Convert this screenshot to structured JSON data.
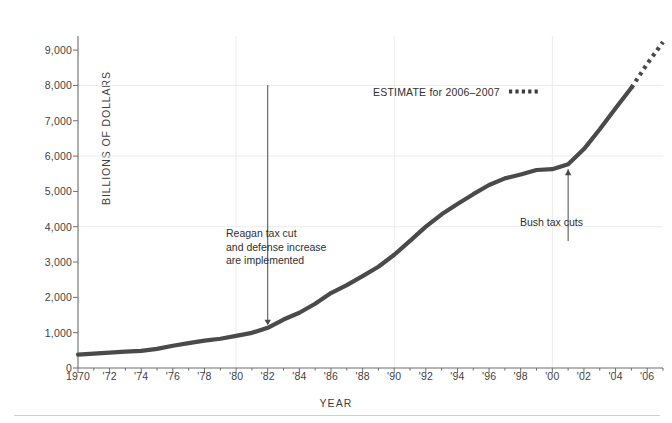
{
  "figure": {
    "clipped_top_text": "",
    "ylabel": "BILLIONS OF DOLLARS",
    "xlabel": "YEAR",
    "estimate_note": "ESTIMATE for 2006–2007",
    "annotations": {
      "reagan_line1": "Reagan tax cut",
      "reagan_line2": "and defense increase",
      "reagan_line3": "are implemented",
      "bush": "Bush tax cuts"
    },
    "colors": {
      "line": "#4a4a4a",
      "axis": "#6d6d6d",
      "grid": "#ececec",
      "text": "#3f3f3f"
    }
  },
  "chart_data": {
    "type": "line",
    "title": "",
    "xlabel": "YEAR",
    "ylabel": "BILLIONS OF DOLLARS",
    "xlim": [
      1970,
      2007
    ],
    "ylim": [
      0,
      9400
    ],
    "yticks": [
      0,
      1000,
      2000,
      3000,
      4000,
      5000,
      6000,
      7000,
      8000,
      9000
    ],
    "ytick_labels": [
      "0",
      "1,000",
      "2,000",
      "3,000",
      "4,000",
      "5,000",
      "6,000",
      "7,000",
      "8,000",
      "9,000"
    ],
    "xticks": [
      1970,
      1972,
      1974,
      1976,
      1978,
      1980,
      1982,
      1984,
      1986,
      1988,
      1990,
      1992,
      1994,
      1996,
      1998,
      2000,
      2002,
      2004,
      2006
    ],
    "xtick_labels": [
      "1970",
      "'72",
      "'74",
      "'76",
      "'78",
      "'80",
      "'82",
      "'84",
      "'86",
      "'88",
      "'90",
      "'92",
      "'94",
      "'96",
      "'98",
      "'00",
      "'02",
      "'04",
      "'06"
    ],
    "grid": {
      "horizontal_at": [
        4000,
        6000,
        8000
      ],
      "vertical_at": [
        1980,
        1990,
        2000
      ]
    },
    "legend": {
      "position": "upper-center",
      "entries": [
        "ESTIMATE for 2006–2007"
      ]
    },
    "series": [
      {
        "name": "Gross federal debt",
        "style": "solid",
        "x": [
          1970,
          1971,
          1972,
          1973,
          1974,
          1975,
          1976,
          1977,
          1978,
          1979,
          1980,
          1981,
          1982,
          1983,
          1984,
          1985,
          1986,
          1987,
          1988,
          1989,
          1990,
          1991,
          1992,
          1993,
          1994,
          1995,
          1996,
          1997,
          1998,
          1999,
          2000,
          2001,
          2002,
          2003,
          2004,
          2005
        ],
        "values": [
          381,
          408,
          436,
          466,
          484,
          541,
          629,
          706,
          777,
          829,
          909,
          995,
          1137,
          1372,
          1565,
          1818,
          2121,
          2346,
          2601,
          2868,
          3206,
          3598,
          4002,
          4351,
          4643,
          4921,
          5181,
          5369,
          5478,
          5606,
          5629,
          5770,
          6198,
          6760,
          7355,
          7933
        ]
      },
      {
        "name": "Estimate",
        "style": "dotted",
        "x": [
          2005,
          2006,
          2007
        ],
        "values": [
          7933,
          8612,
          9230
        ]
      }
    ],
    "annotations": [
      {
        "text": "Reagan tax cut and defense increase are implemented",
        "x": 1982,
        "y": 1137,
        "arrow": "down"
      },
      {
        "text": "Bush tax cuts",
        "x": 2001,
        "y": 5770,
        "arrow": "up"
      }
    ]
  }
}
